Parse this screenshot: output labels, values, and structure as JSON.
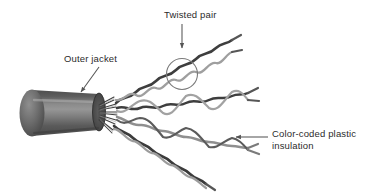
{
  "figure": {
    "background": "#ffffff",
    "labels": {
      "twisted_pair": "Twisted pair",
      "outer_jacket": "Outer jacket",
      "color_coded_line1": "Color-coded plastic",
      "color_coded_line2": "insulation",
      "color_coded_full": "Color-coded plastic insulation"
    },
    "colors": {
      "text": "#2b2b2b",
      "jacket_dark": "#4a4a4a",
      "jacket_mid": "#6e6e6e",
      "jacket_light": "#8d8d8d",
      "jacket_edge": "#3a3a3a",
      "end_face": "#565656",
      "wire_dark": "#454545",
      "wire_mid": "#6a6a6a",
      "wire_light": "#a8a8a8",
      "arrow": "#555555",
      "circle_highlight": "#777777"
    },
    "annotations": {
      "twisted_pair_arrow": "vertical arrow pointing down to circled twist",
      "outer_jacket_arrow": "diagonal arrow pointing down-left to jacket",
      "color_coded_arrow": "horizontal arrow pointing left to wire",
      "highlight_circle": "circle around one twist of the top pair"
    },
    "structure": {
      "pair_count": 4,
      "wires_per_pair": 2,
      "jacket_shape": "cylinder",
      "pair_labels": [
        "pair-1",
        "pair-2",
        "pair-3",
        "pair-4"
      ]
    }
  }
}
